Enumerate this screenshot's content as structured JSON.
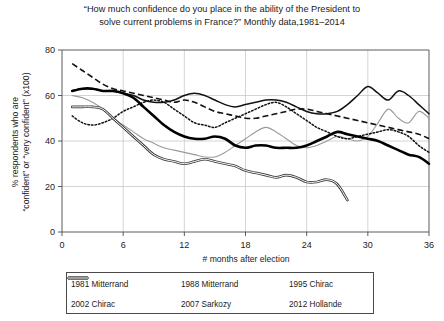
{
  "chart_data": {
    "type": "line",
    "title": "“How much confidence do you place in the ability of the President to solve current problems in France?” Monthly data,1981–2014",
    "title_line1": "“How much confidence do you place in the ability of the President to",
    "title_line2": "solve current problems in France?” Monthly data,1981–2014",
    "xlabel": "# months after election",
    "ylabel": "% respondents who are “confident” or “very confident” (x100)",
    "ylabel_line1": "% respondents who are",
    "ylabel_line2": "“confident” or “very confident” (x100)",
    "xlim": [
      0,
      36
    ],
    "ylim": [
      0,
      80
    ],
    "xticks": [
      0,
      6,
      12,
      18,
      24,
      30,
      36
    ],
    "yticks": [
      0,
      20,
      40,
      60,
      80
    ],
    "grid": true,
    "grid_color": "#c9c9c9",
    "legend_position": "below-axes",
    "series": [
      {
        "name": "1981 Mitterrand",
        "style": "dashed",
        "color": "#111111",
        "width": 1.6,
        "x": [
          1,
          2,
          3,
          4,
          5,
          6,
          7,
          8,
          9,
          10,
          11,
          12,
          13,
          14,
          15,
          16,
          17,
          18,
          19,
          20,
          21,
          22,
          23,
          24,
          25,
          26,
          27,
          28,
          29,
          30,
          31,
          32,
          33,
          34,
          35,
          36
        ],
        "y": [
          74,
          71,
          68,
          65,
          63,
          62,
          61,
          60,
          59,
          58,
          57,
          58,
          57,
          55,
          53,
          52,
          51,
          50,
          50,
          51,
          52,
          53,
          54,
          54,
          53,
          52,
          51,
          50,
          49,
          48,
          47,
          46,
          45,
          44,
          43,
          41
        ]
      },
      {
        "name": "1988 Mitterrand",
        "style": "solid",
        "color": "#111111",
        "width": 1.5,
        "x": [
          1,
          2,
          3,
          4,
          5,
          6,
          7,
          8,
          9,
          10,
          11,
          12,
          13,
          14,
          15,
          16,
          17,
          18,
          19,
          20,
          21,
          22,
          23,
          24,
          25,
          26,
          27,
          28,
          29,
          30,
          31,
          32,
          33,
          34,
          35,
          36
        ],
        "y": [
          62,
          63,
          63,
          62,
          62,
          61,
          60,
          58,
          57,
          57,
          58,
          60,
          61,
          60,
          58,
          56,
          55,
          56,
          57,
          58,
          58,
          57,
          55,
          53,
          52,
          52,
          53,
          56,
          60,
          64,
          61,
          58,
          62,
          60,
          56,
          52
        ]
      },
      {
        "name": "1995 Chirac",
        "style": "solid",
        "color": "#9a9a9a",
        "width": 1.1,
        "x": [
          1,
          2,
          3,
          4,
          5,
          6,
          7,
          8,
          9,
          10,
          11,
          12,
          13,
          14,
          15,
          16,
          17,
          18,
          19,
          20,
          21,
          22,
          23,
          24,
          25,
          26,
          27,
          28,
          29,
          30,
          31,
          32,
          33,
          34,
          35,
          36
        ],
        "y": [
          60,
          59,
          57,
          54,
          50,
          47,
          44,
          41,
          39,
          37,
          36,
          35,
          34,
          33,
          33,
          35,
          38,
          41,
          44,
          46,
          44,
          41,
          38,
          37,
          38,
          40,
          42,
          41,
          40,
          42,
          48,
          54,
          50,
          48,
          53,
          50
        ]
      },
      {
        "name": "2002 Chirac",
        "style": "dotted",
        "color": "#111111",
        "width": 1.5,
        "x": [
          1,
          2,
          3,
          4,
          5,
          6,
          7,
          8,
          9,
          10,
          11,
          12,
          13,
          14,
          15,
          16,
          17,
          18,
          19,
          20,
          21,
          22,
          23,
          24,
          25,
          26,
          27,
          28,
          29,
          30,
          31,
          32,
          33,
          34,
          35,
          36
        ],
        "y": [
          51,
          48,
          47,
          48,
          50,
          53,
          55,
          57,
          58,
          57,
          54,
          51,
          48,
          47,
          46,
          48,
          50,
          52,
          54,
          56,
          57,
          55,
          52,
          49,
          46,
          44,
          42,
          41,
          42,
          43,
          44,
          45,
          44,
          42,
          38,
          35
        ]
      },
      {
        "name": "2007 Sarkozy",
        "style": "solid",
        "color": "#000000",
        "width": 2.6,
        "x": [
          1,
          2,
          3,
          4,
          5,
          6,
          7,
          8,
          9,
          10,
          11,
          12,
          13,
          14,
          15,
          16,
          17,
          18,
          19,
          20,
          21,
          22,
          23,
          24,
          25,
          26,
          27,
          28,
          29,
          30,
          31,
          32,
          33,
          34,
          35,
          36
        ],
        "y": [
          62,
          63,
          63,
          62,
          62,
          61,
          59,
          55,
          51,
          47,
          44,
          42,
          41,
          41,
          42,
          41,
          38,
          37,
          38,
          38,
          37,
          37,
          37,
          38,
          40,
          42,
          44,
          43,
          42,
          41,
          40,
          38,
          36,
          34,
          33,
          30
        ]
      },
      {
        "name": "2012 Hollande",
        "style": "double",
        "color": "#8f8f8f",
        "width": 2.6,
        "x": [
          1,
          2,
          3,
          4,
          5,
          6,
          7,
          8,
          9,
          10,
          11,
          12,
          13,
          14,
          15,
          16,
          17,
          18,
          19,
          20,
          21,
          22,
          23,
          24,
          25,
          26,
          27,
          28
        ],
        "y": [
          55,
          55,
          55,
          54,
          50,
          46,
          42,
          38,
          34,
          32,
          31,
          30,
          31,
          32,
          31,
          30,
          29,
          27,
          26,
          25,
          24,
          25,
          24,
          22,
          22,
          23,
          21,
          14
        ]
      }
    ]
  },
  "legend": {
    "entries": [
      {
        "label": "1981 Mitterrand",
        "style": "dashed"
      },
      {
        "label": "1988 Mitterrand",
        "style": "solid"
      },
      {
        "label": "1995 Chirac",
        "style": "thin-gray"
      },
      {
        "label": "2002 Chirac",
        "style": "dotted"
      },
      {
        "label": "2007 Sarkozy",
        "style": "thick-solid"
      },
      {
        "label": "2012 Hollande",
        "style": "double-gray"
      }
    ]
  }
}
